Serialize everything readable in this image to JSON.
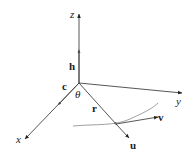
{
  "diagram": {
    "type": "3d-vector-diagram",
    "colors": {
      "line": "#333333",
      "curve": "#777777",
      "background": "#ffffff"
    },
    "axes": {
      "z": {
        "label": "z"
      },
      "y": {
        "label": "y"
      },
      "x": {
        "label": "x"
      }
    },
    "vectors": {
      "h": {
        "label": "h"
      },
      "c": {
        "label": "c"
      },
      "r": {
        "label": "r"
      },
      "u": {
        "label": "u"
      },
      "v": {
        "label": "v"
      }
    },
    "angle": {
      "label": "θ"
    }
  }
}
